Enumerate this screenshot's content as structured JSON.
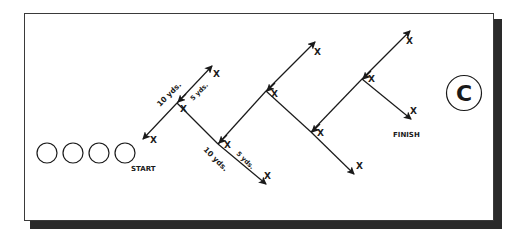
{
  "diagram": {
    "badge_letter": "C",
    "start_label": "START",
    "finish_label": "FINISH",
    "cone_marker": "X",
    "distance_long": "10 yds.",
    "distance_short": "5 yds.",
    "players_in_line": 4,
    "colors": {
      "ink": "#1a1a1a",
      "shadow": "#2a2a2a",
      "background": "#ffffff"
    }
  }
}
